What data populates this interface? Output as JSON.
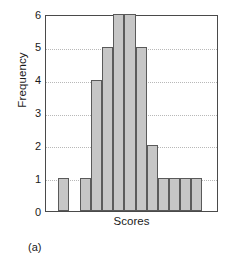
{
  "figure": {
    "caption": "(a)"
  },
  "chart_data": {
    "type": "bar",
    "title": "",
    "xlabel": "Scores",
    "ylabel": "Frequency",
    "ylim": [
      0,
      6
    ],
    "yticks": [
      "6",
      "5",
      "4",
      "3",
      "2",
      "1",
      "0"
    ],
    "ytick_values": [
      6,
      5,
      4,
      3,
      2,
      1,
      0
    ],
    "xticks": [],
    "grid": "horizontal-dotted",
    "legend": "none",
    "bar_color": "#c6c6c6",
    "bar_edge_color": "#5a5a5a",
    "axis_color": "#4a4a4a",
    "grid_color": "#b8b8b8",
    "bin_count": 13,
    "categories": [
      "1",
      "2",
      "3",
      "4",
      "5",
      "6",
      "7",
      "8",
      "9",
      "10",
      "11",
      "12",
      "13"
    ],
    "values": [
      1,
      0,
      1,
      4,
      5,
      6,
      6,
      5,
      2,
      1,
      1,
      1,
      1
    ],
    "bars": [
      {
        "index": 0,
        "value": 1
      },
      {
        "index": 1,
        "value": 0
      },
      {
        "index": 2,
        "value": 1
      },
      {
        "index": 3,
        "value": 4
      },
      {
        "index": 4,
        "value": 5
      },
      {
        "index": 5,
        "value": 6
      },
      {
        "index": 6,
        "value": 6
      },
      {
        "index": 7,
        "value": 5
      },
      {
        "index": 8,
        "value": 2
      },
      {
        "index": 9,
        "value": 1
      },
      {
        "index": 10,
        "value": 1
      },
      {
        "index": 11,
        "value": 1
      },
      {
        "index": 12,
        "value": 1
      }
    ]
  }
}
